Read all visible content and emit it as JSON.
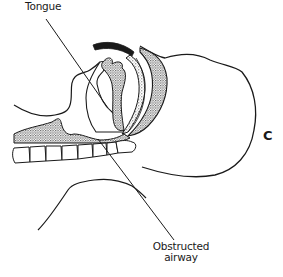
{
  "figure": {
    "panel_letter": "C",
    "labels": {
      "tongue": "Tongue",
      "obstructed_airway_line1": "Obstructed",
      "obstructed_airway_line2": "airway"
    },
    "colors": {
      "ink": "#1a1a1a",
      "background": "#ffffff",
      "stipple": "#555555"
    }
  }
}
